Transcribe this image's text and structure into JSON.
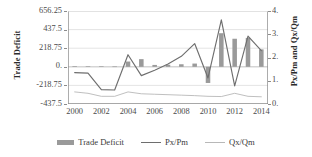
{
  "chart_data": {
    "type": "bar",
    "title": "",
    "xlabel": "",
    "ylabel": "Trade Deficit",
    "y2label": "Px/Pm and Qx/Qm",
    "grid": true,
    "legend_position": "bottom",
    "x": [
      2000,
      2001,
      2002,
      2003,
      2004,
      2005,
      2006,
      2007,
      2008,
      2009,
      2010,
      2011,
      2012,
      2013,
      2014
    ],
    "x_tick_labels": [
      "2000",
      "2002",
      "2004",
      "2006",
      "2008",
      "2010",
      "2012",
      "2014"
    ],
    "x_tick_values": [
      2000,
      2002,
      2004,
      2006,
      2008,
      2010,
      2012,
      2014
    ],
    "ylim": [
      -437.5,
      656.25
    ],
    "y_tick_labels": [
      "656.25",
      "437.5",
      "218.75",
      "0.",
      "-218.75",
      "-437.5"
    ],
    "y_tick_values": [
      656.25,
      437.5,
      218.75,
      0,
      -218.75,
      -437.5
    ],
    "y2lim": [
      0,
      4
    ],
    "y2_tick_labels": [
      "4.",
      "3.",
      "2.",
      "1.",
      "0."
    ],
    "y2_tick_values": [
      4,
      3,
      2,
      1,
      0
    ],
    "series": [
      {
        "name": "Trade Deficit",
        "type": "bar",
        "axis": "left",
        "color": "#9a9a9a",
        "values": [
          8,
          6,
          5,
          4,
          62,
          90,
          22,
          24,
          30,
          38,
          -190,
          395,
          330,
          340,
          205
        ]
      },
      {
        "name": "Px/Pm",
        "type": "line",
        "axis": "right",
        "color": "#6e6e6e",
        "values": [
          1.35,
          1.33,
          0.62,
          0.6,
          2.12,
          1.22,
          1.45,
          1.72,
          2.05,
          2.6,
          1.12,
          3.62,
          0.78,
          2.92,
          2.3
        ]
      },
      {
        "name": "Qx/Qm",
        "type": "line",
        "axis": "right",
        "color": "#b8b8b8",
        "values": [
          0.52,
          0.46,
          0.33,
          0.33,
          0.52,
          0.44,
          0.42,
          0.4,
          0.38,
          0.36,
          0.33,
          0.32,
          0.46,
          0.33,
          0.31
        ]
      }
    ]
  },
  "legend": {
    "items": [
      {
        "label": "Trade Deficit",
        "marker": "bar",
        "color": "#9a9a9a"
      },
      {
        "label": "Px/Pm",
        "marker": "line",
        "color": "#6e6e6e"
      },
      {
        "label": "Qx/Qm",
        "marker": "line",
        "color": "#b8b8b8"
      }
    ]
  },
  "axes": {
    "left_title": "Trade Deficit",
    "right_title": "Px/Pm and Qx/Qm"
  },
  "colors": {
    "bar": "#9a9a9a",
    "line_primary": "#6e6e6e",
    "line_secondary": "#b8b8b8",
    "gridline": "#d9d9d9",
    "axis": "#8c8c8c",
    "text": "#3a3a3a"
  }
}
